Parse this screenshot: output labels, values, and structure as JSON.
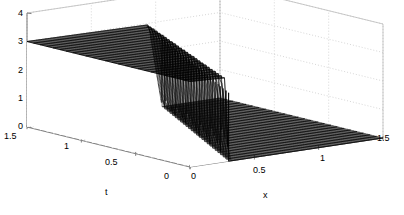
{
  "figure": {
    "kind": "3d-mesh-surface",
    "background": "#ffffff",
    "line_color": "#000000",
    "grid_color": "#bbbbbb",
    "axis_color": "#808080"
  },
  "chart_data": {
    "type": "line",
    "subtype": "3d-waterfall-mesh",
    "title": "",
    "xlabel": "x",
    "ylabel": "t",
    "zlabel": "",
    "xlim": [
      0,
      1.5
    ],
    "ylim": [
      0,
      1.5
    ],
    "zlim": [
      0,
      4
    ],
    "xticks": [
      0,
      0.5,
      1,
      1.5
    ],
    "xtick_labels": [
      "0",
      "0.5",
      "1",
      "1.5"
    ],
    "yticks": [
      0,
      0.5,
      1,
      1.5
    ],
    "ytick_labels": [
      "0",
      "0.5",
      "1",
      "1.5"
    ],
    "zticks": [
      0,
      1,
      2,
      3,
      4
    ],
    "ztick_labels": [
      "0",
      "1",
      "2",
      "3",
      "4"
    ],
    "grid": true,
    "legend": null,
    "series": [
      {
        "name": "u(x,t)",
        "plateau_value": 3.0,
        "base_value": 0.0,
        "front_positions_x": [
          0.3,
          0.33,
          0.36,
          0.39,
          0.42,
          0.45,
          0.48,
          0.51,
          0.54,
          0.57,
          0.6,
          0.63,
          0.66,
          0.69,
          0.72,
          0.75,
          0.78,
          0.81,
          0.84,
          0.87,
          0.9,
          0.93,
          0.96,
          0.99,
          1.02,
          1.05
        ],
        "t_values": [
          0.0,
          0.06,
          0.12,
          0.18,
          0.24,
          0.3,
          0.36,
          0.42,
          0.48,
          0.54,
          0.6,
          0.66,
          0.72,
          0.78,
          0.84,
          0.9,
          0.96,
          1.02,
          1.08,
          1.14,
          1.2,
          1.26,
          1.32,
          1.38,
          1.44,
          1.5
        ]
      }
    ]
  },
  "axes": {
    "x_axis": {
      "name": "x",
      "title": "x",
      "ticks": [
        {
          "label": "0",
          "value": 0
        },
        {
          "label": "0.5",
          "value": 0.5
        },
        {
          "label": "1",
          "value": 1
        },
        {
          "label": "1.5",
          "value": 1.5
        }
      ]
    },
    "t_axis": {
      "name": "t",
      "title": "t",
      "ticks": [
        {
          "label": "1.5",
          "value": 1.5
        },
        {
          "label": "1",
          "value": 1
        },
        {
          "label": "0.5",
          "value": 0.5
        },
        {
          "label": "0",
          "value": 0
        }
      ]
    },
    "z_axis": {
      "name": "z",
      "title": "",
      "ticks": [
        {
          "label": "4",
          "value": 4
        },
        {
          "label": "3",
          "value": 3
        },
        {
          "label": "2",
          "value": 2
        },
        {
          "label": "1",
          "value": 1
        },
        {
          "label": "0",
          "value": 0
        }
      ]
    }
  }
}
